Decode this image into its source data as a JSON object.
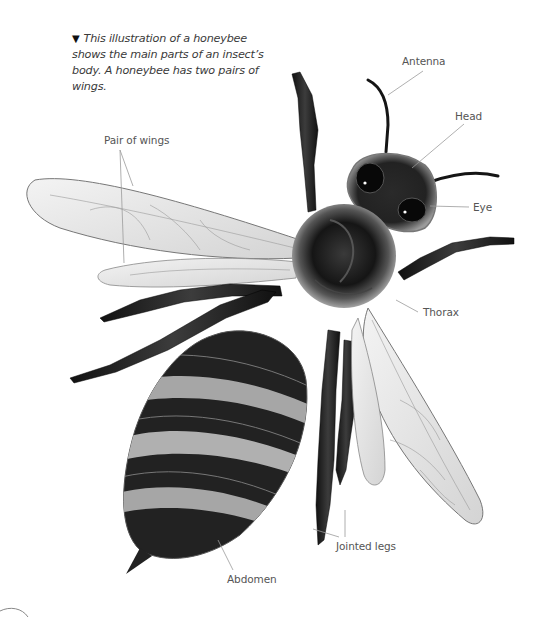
{
  "caption": {
    "marker": "▼",
    "text": "This illustration of a honeybee shows the main parts of an insect’s body. A honeybee has two pairs of wings."
  },
  "labels": {
    "antenna": "Antenna",
    "head": "Head",
    "eye": "Eye",
    "pair_of_wings": "Pair of wings",
    "thorax": "Thorax",
    "jointed_legs": "Jointed legs",
    "abdomen": "Abdomen"
  },
  "colors": {
    "background": "#ffffff",
    "label_text": "#555555",
    "leader_line": "#9a9a9a",
    "body_dark": "#1a1a1a",
    "fur": "#8c8c8c",
    "wing": "#e6e6e6"
  }
}
